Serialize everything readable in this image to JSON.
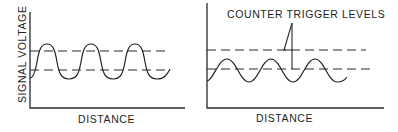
{
  "diagram": {
    "left_panel": {
      "y_label": "SIGNAL VOLTAGE",
      "x_label": "DISTANCE",
      "description": "Large-amplitude signal crossing both trigger levels"
    },
    "right_panel": {
      "x_label": "DISTANCE",
      "annotation": "COUNTER TRIGGER LEVELS",
      "description": "Small-amplitude signal crossing only the lower trigger level"
    },
    "colors": {
      "ink": "#222222",
      "background": "#ffffff"
    }
  }
}
